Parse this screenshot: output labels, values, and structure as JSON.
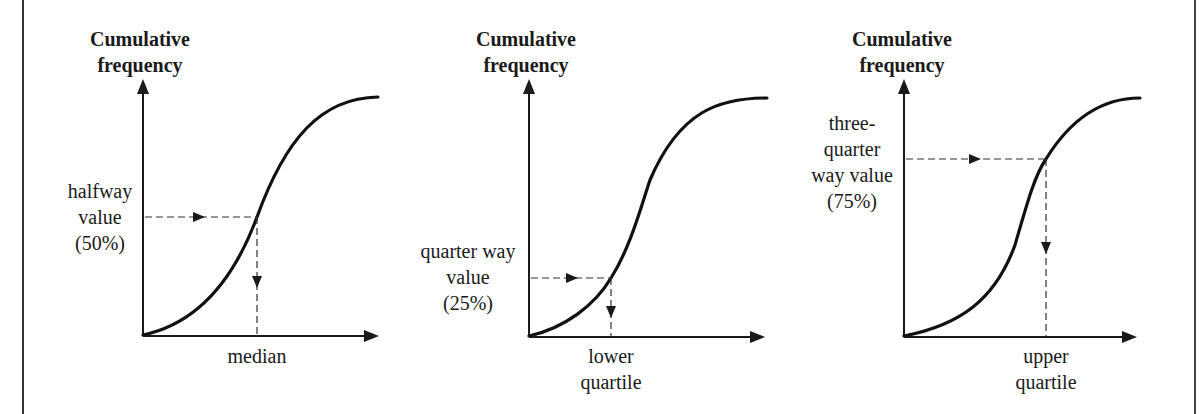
{
  "figure": {
    "panels": [
      {
        "id": "median",
        "y_axis_label": [
          "Cumulative",
          "frequency"
        ],
        "y_annotation": [
          "halfway",
          "value",
          "(50%)"
        ],
        "x_annotation": [
          "median"
        ],
        "percent": 50
      },
      {
        "id": "lower-quartile",
        "y_axis_label": [
          "Cumulative",
          "frequency"
        ],
        "y_annotation": [
          "quarter way",
          "value",
          "(25%)"
        ],
        "x_annotation": [
          "lower",
          "quartile"
        ],
        "percent": 25
      },
      {
        "id": "upper-quartile",
        "y_axis_label": [
          "Cumulative",
          "frequency"
        ],
        "y_annotation": [
          "three-",
          "quarter",
          "way value",
          "(75%)"
        ],
        "x_annotation": [
          "upper",
          "quartile"
        ],
        "percent": 75
      }
    ],
    "colors": {
      "ink": "#1a1a1a",
      "background": "#ffffff"
    }
  }
}
